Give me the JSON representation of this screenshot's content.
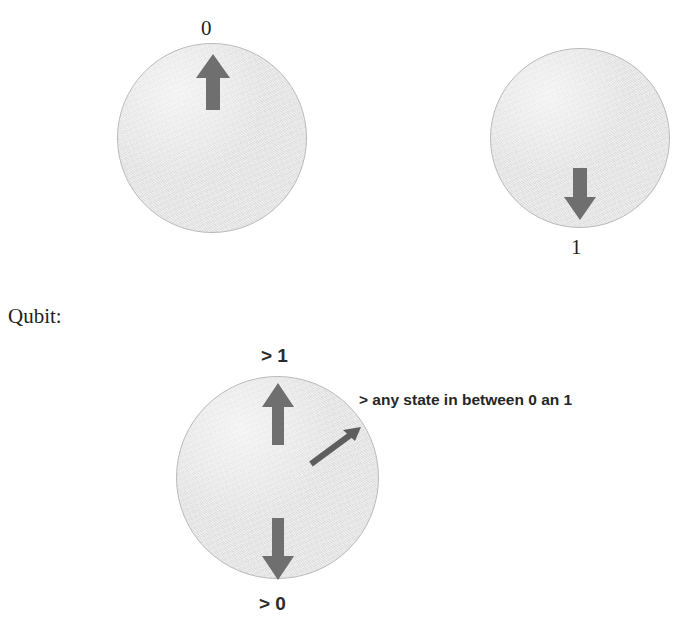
{
  "page": {
    "title_note": "Qubit illustration with classical bit states and superposition",
    "background_color": "#ffffff",
    "width": 690,
    "height": 617
  },
  "colors": {
    "circle_fill": "#e2e2e2",
    "circle_stroke": "#b9b9b9",
    "arrow_fill": "#6f6f6f",
    "thin_arrow": "#5e5e5e",
    "text": "#231f20"
  },
  "heading": {
    "label": "Qubit:"
  },
  "bit_zero": {
    "label": "0",
    "arrow_direction": "up",
    "circle": {
      "cx": 212,
      "cy": 138,
      "r": 95
    }
  },
  "bit_one": {
    "label": "1",
    "arrow_direction": "down",
    "circle": {
      "cx": 579,
      "cy": 138,
      "r": 90
    }
  },
  "qubit": {
    "top_label": "> 1",
    "bottom_label": "> 0",
    "annotation": "> any state in between 0 an 1",
    "circle": {
      "cx": 277,
      "cy": 478,
      "r": 102
    },
    "arrows": [
      {
        "name": "up-arrow",
        "direction": "up"
      },
      {
        "name": "down-arrow",
        "direction": "down"
      },
      {
        "name": "diagonal-superposition-arrow",
        "direction": "up-right"
      }
    ]
  }
}
